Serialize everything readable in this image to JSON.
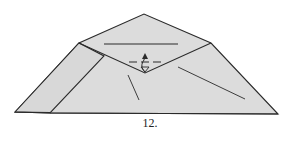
{
  "diagram": {
    "type": "origami-fold-step",
    "step_label": "12.",
    "colors": {
      "paper": "#dcdcdc",
      "stroke": "#2a2a2a",
      "background": "#ffffff"
    },
    "symbols": [
      "fold-up-arrow",
      "dashed-fold-line",
      "crease-lines"
    ]
  }
}
